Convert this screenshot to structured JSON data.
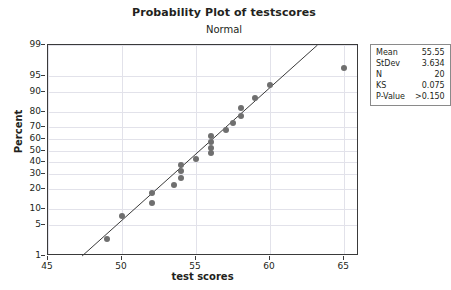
{
  "chart_data": {
    "type": "scatter",
    "title": "Probability Plot of testscores",
    "subtitle": "Normal",
    "xlabel": "test scores",
    "ylabel": "Percent",
    "xlim": [
      45,
      66
    ],
    "xticks": [
      45,
      50,
      55,
      60,
      65
    ],
    "yticks": [
      1,
      5,
      10,
      20,
      30,
      40,
      50,
      60,
      70,
      80,
      90,
      95,
      99
    ],
    "ylim": [
      1,
      99
    ],
    "grid": true,
    "legend_position": "right",
    "marker_color": "#6f6f6f",
    "line_color": "#3a3a3a",
    "grid_color": "#e2e2ea",
    "points": [
      {
        "x": 49.0,
        "percent": 2.5
      },
      {
        "x": 50.0,
        "percent": 7.5
      },
      {
        "x": 52.0,
        "percent": 12.5
      },
      {
        "x": 52.0,
        "percent": 17.5
      },
      {
        "x": 53.5,
        "percent": 22.5
      },
      {
        "x": 54.0,
        "percent": 27.5
      },
      {
        "x": 54.0,
        "percent": 32.5
      },
      {
        "x": 54.0,
        "percent": 37.5
      },
      {
        "x": 55.0,
        "percent": 42.5
      },
      {
        "x": 56.0,
        "percent": 47.5
      },
      {
        "x": 56.0,
        "percent": 52.5
      },
      {
        "x": 56.0,
        "percent": 57.5
      },
      {
        "x": 56.0,
        "percent": 62.5
      },
      {
        "x": 57.0,
        "percent": 67.5
      },
      {
        "x": 57.5,
        "percent": 72.5
      },
      {
        "x": 58.0,
        "percent": 77.5
      },
      {
        "x": 58.0,
        "percent": 82.5
      },
      {
        "x": 59.0,
        "percent": 87.5
      },
      {
        "x": 60.0,
        "percent": 92.5
      },
      {
        "x": 65.0,
        "percent": 96.5
      }
    ],
    "fit_line": {
      "from": {
        "x": 47.3,
        "percent": 1
      },
      "to": {
        "x": 63.2,
        "percent": 99
      }
    },
    "stats": [
      {
        "key": "Mean",
        "value": "55.55"
      },
      {
        "key": "StDev",
        "value": "3.634"
      },
      {
        "key": "N",
        "value": "20"
      },
      {
        "key": "KS",
        "value": "0.075"
      },
      {
        "key": "P-Value",
        "value": ">0.150"
      }
    ]
  }
}
